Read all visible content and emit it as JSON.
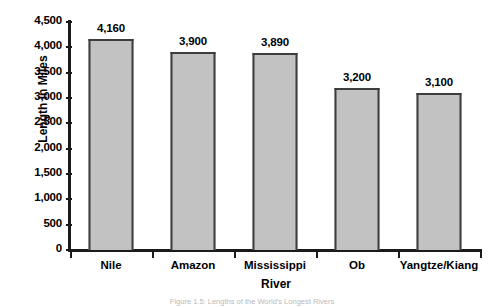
{
  "chart_data": {
    "type": "bar",
    "title": "",
    "xlabel": "River",
    "ylabel": "Length in Miles",
    "categories": [
      "Nile",
      "Amazon",
      "Mississippi",
      "Ob",
      "Yangtze/Kiang"
    ],
    "values": [
      4160,
      3900,
      3890,
      3200,
      3100
    ],
    "value_labels": [
      "4,160",
      "3,900",
      "3,890",
      "3,200",
      "3,100"
    ],
    "ylim": [
      0,
      4500
    ],
    "ytick_values": [
      0,
      500,
      1000,
      1500,
      2000,
      2500,
      3000,
      3500,
      4000,
      4500
    ],
    "ytick_labels": [
      "0",
      "500",
      "1,000",
      "1,500",
      "2,000",
      "2,500",
      "3,000",
      "3,500",
      "4,000",
      "4,500"
    ],
    "grid": false,
    "legend": false,
    "bar_color": "#c2c2c2",
    "bar_border_color": "#3d3d3d",
    "axis_color": "#1a1a1a",
    "background_color": "#ffffff"
  },
  "caption": {
    "text": "Figure 1.5: Lengths of the World's Longest Rivers"
  }
}
